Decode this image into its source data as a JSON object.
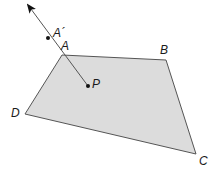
{
  "diagram": {
    "type": "geometry-quadrilateral-with-ray",
    "colors": {
      "fill": "#dcdcdc",
      "stroke": "#555555",
      "ray": "#555555",
      "point": "#111111"
    },
    "vertices": {
      "A": {
        "label": "A",
        "x": 62,
        "y": 55,
        "label_x": 61,
        "label_y": 50
      },
      "B": {
        "label": "B",
        "x": 166,
        "y": 60,
        "label_x": 160,
        "label_y": 54
      },
      "C": {
        "label": "C",
        "x": 196,
        "y": 154,
        "label_x": 199,
        "label_y": 165
      },
      "D": {
        "label": "D",
        "x": 25,
        "y": 114,
        "label_x": 11,
        "label_y": 117
      }
    },
    "points": {
      "P": {
        "label": "P",
        "x": 88,
        "y": 86,
        "label_x": 92,
        "label_y": 88
      },
      "A_prime": {
        "label": "A´",
        "x": 48,
        "y": 38,
        "label_x": 53,
        "label_y": 37
      }
    },
    "ray": {
      "from": "P",
      "through": [
        "A",
        "A_prime"
      ],
      "tip_x": 27,
      "tip_y": 4
    }
  }
}
